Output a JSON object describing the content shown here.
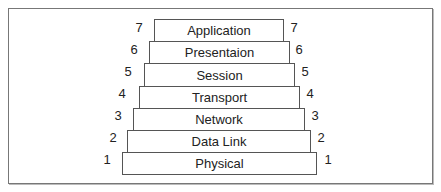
{
  "diagram": {
    "layers": [
      {
        "number": "7",
        "name": "Application"
      },
      {
        "number": "6",
        "name": "Presentaion"
      },
      {
        "number": "5",
        "name": "Session"
      },
      {
        "number": "4",
        "name": "Transport"
      },
      {
        "number": "3",
        "name": "Network"
      },
      {
        "number": "2",
        "name": "Data Link"
      },
      {
        "number": "1",
        "name": "Physical"
      }
    ]
  }
}
